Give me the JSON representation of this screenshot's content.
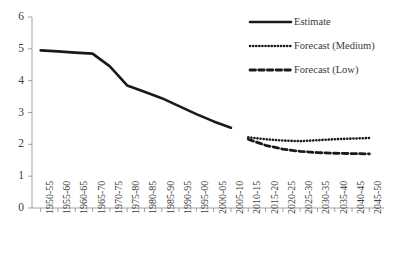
{
  "chart_data": {
    "type": "line",
    "title": "",
    "subtitle": "",
    "xlabel": "",
    "ylabel": "",
    "ylim": [
      0,
      6
    ],
    "ytick_values": [
      0,
      1,
      2,
      3,
      4,
      5,
      6
    ],
    "ytick_labels": [
      "0",
      "1",
      "2",
      "3",
      "4",
      "5",
      "6"
    ],
    "grid": false,
    "legend_position": "top-right",
    "categories": [
      "1950-55",
      "1955-60",
      "1960-65",
      "1965-70",
      "1970-75",
      "1975-80",
      "1980-85",
      "1985-90",
      "1990-95",
      "1995-00",
      "2000-05",
      "2005-10",
      "2010-15",
      "2015-20",
      "2020-25",
      "2025-30",
      "2030-35",
      "2035-40",
      "2040-45",
      "2045-50"
    ],
    "series": [
      {
        "name": "Estimate",
        "style": "solid",
        "color": "#1a1a1a",
        "values": [
          4.95,
          4.92,
          4.88,
          4.85,
          4.45,
          3.85,
          3.65,
          3.45,
          3.2,
          2.95,
          2.72,
          2.52,
          null,
          null,
          null,
          null,
          null,
          null,
          null,
          null
        ]
      },
      {
        "name": "Forecast (Medium)",
        "style": "dotted",
        "color": "#1a1a1a",
        "values": [
          null,
          null,
          null,
          null,
          null,
          null,
          null,
          null,
          null,
          null,
          null,
          null,
          2.22,
          2.16,
          2.12,
          2.1,
          2.13,
          2.16,
          2.18,
          2.2
        ]
      },
      {
        "name": "Forecast (Low)",
        "style": "dashed",
        "color": "#1a1a1a",
        "values": [
          null,
          null,
          null,
          null,
          null,
          null,
          null,
          null,
          null,
          null,
          null,
          null,
          2.16,
          1.97,
          1.85,
          1.78,
          1.74,
          1.72,
          1.71,
          1.7
        ]
      }
    ],
    "legend": [
      {
        "label": "Estimate",
        "style": "solid"
      },
      {
        "label": "Forecast (Medium)",
        "style": "dotted"
      },
      {
        "label": "Forecast (Low)",
        "style": "dashed"
      }
    ],
    "axis_color": "#8a8a8a",
    "line_color": "#1a1a1a"
  }
}
